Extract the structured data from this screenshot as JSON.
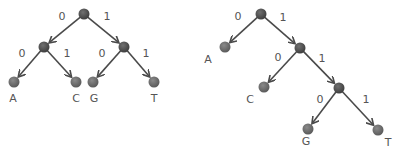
{
  "colors": {
    "internal_node": "#4f4f4f",
    "leaf_node": "#6e6e6e",
    "edge": "#4a4a4a",
    "text": "#555555"
  },
  "trees": [
    {
      "name": "balanced-tree",
      "nodes": [
        {
          "id": "r",
          "type": "internal",
          "x": 84,
          "y": 14
        },
        {
          "id": "n0",
          "type": "internal",
          "x": 44,
          "y": 47
        },
        {
          "id": "n1",
          "type": "internal",
          "x": 124,
          "y": 47
        },
        {
          "id": "A",
          "type": "leaf",
          "x": 14,
          "y": 82,
          "label": "A",
          "lx": 13,
          "ly": 102
        },
        {
          "id": "C",
          "type": "leaf",
          "x": 76,
          "y": 82,
          "label": "C",
          "lx": 76,
          "ly": 102
        },
        {
          "id": "G",
          "type": "leaf",
          "x": 93,
          "y": 82,
          "label": "G",
          "lx": 94,
          "ly": 102
        },
        {
          "id": "T",
          "type": "leaf",
          "x": 154,
          "y": 82,
          "label": "T",
          "lx": 154,
          "ly": 102
        }
      ],
      "edges": [
        {
          "from": "r",
          "to": "n0",
          "bit": "0",
          "bx": 62,
          "by": 20
        },
        {
          "from": "r",
          "to": "n1",
          "bit": "1",
          "bx": 107,
          "by": 20
        },
        {
          "from": "n0",
          "to": "A",
          "bit": "0",
          "bx": 22,
          "by": 57
        },
        {
          "from": "n0",
          "to": "C",
          "bit": "1",
          "bx": 67,
          "by": 57
        },
        {
          "from": "n1",
          "to": "G",
          "bit": "0",
          "bx": 102,
          "by": 57
        },
        {
          "from": "n1",
          "to": "T",
          "bit": "1",
          "bx": 146,
          "by": 57
        }
      ]
    },
    {
      "name": "skewed-tree",
      "nodes": [
        {
          "id": "r",
          "type": "internal",
          "x": 261,
          "y": 14
        },
        {
          "id": "A",
          "type": "leaf",
          "x": 225,
          "y": 47,
          "label": "A",
          "lx": 208,
          "ly": 63
        },
        {
          "id": "n1",
          "type": "internal",
          "x": 300,
          "y": 48
        },
        {
          "id": "C",
          "type": "leaf",
          "x": 264,
          "y": 87,
          "label": "C",
          "lx": 250,
          "ly": 103
        },
        {
          "id": "n2",
          "type": "internal",
          "x": 339,
          "y": 88
        },
        {
          "id": "G",
          "type": "leaf",
          "x": 308,
          "y": 129,
          "label": "G",
          "lx": 306,
          "ly": 145
        },
        {
          "id": "T",
          "type": "leaf",
          "x": 378,
          "y": 130,
          "label": "T",
          "lx": 388,
          "ly": 146
        }
      ],
      "edges": [
        {
          "from": "r",
          "to": "A",
          "bit": "0",
          "bx": 238,
          "by": 20
        },
        {
          "from": "r",
          "to": "n1",
          "bit": "1",
          "bx": 283,
          "by": 21
        },
        {
          "from": "n1",
          "to": "C",
          "bit": "0",
          "bx": 278,
          "by": 61
        },
        {
          "from": "n1",
          "to": "n2",
          "bit": "1",
          "bx": 322,
          "by": 62
        },
        {
          "from": "n2",
          "to": "G",
          "bit": "0",
          "bx": 320,
          "by": 103
        },
        {
          "from": "n2",
          "to": "T",
          "bit": "1",
          "bx": 366,
          "by": 103
        }
      ]
    }
  ]
}
